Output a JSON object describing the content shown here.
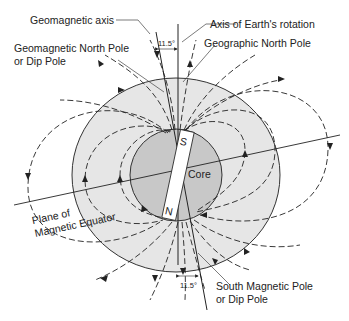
{
  "figure": {
    "labels": {
      "geomagnetic_axis": "Geomagnetic axis",
      "rotation_axis": "Axis of Earth's rotation",
      "geomagnetic_north_pole_line1": "Geomagnetic North Pole",
      "geomagnetic_north_pole_line2": "or Dip Pole",
      "geographic_north_pole": "Geographic North Pole",
      "plane_of": "Plane of",
      "magnetic_equator": "Magnetic Equator",
      "core": "Core",
      "magnet_south": "S",
      "magnet_north": "N",
      "south_magnetic_pole_line1": "South Magnetic Pole",
      "south_magnetic_pole_line2": "or Dip Pole",
      "tilt_angle_top": "11.5°",
      "tilt_angle_bottom": "11.5°"
    },
    "colors": {
      "mantle": "#e6e6e6",
      "core": "#c8c8c8",
      "magnet": "#ffffff",
      "lines": "#222222"
    }
  }
}
